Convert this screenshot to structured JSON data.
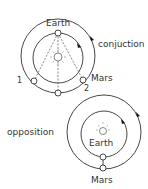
{
  "conjunction": {
    "title": "conjuction",
    "earth_label": "Earth",
    "mars_label": "Mars",
    "position_1_label": "1",
    "position_2_label": "2"
  },
  "opposition": {
    "title": "opposition",
    "earth_label": "Earth",
    "mars_label": "Mars"
  },
  "colors": {
    "line": "#333333",
    "background": "#ffffff"
  }
}
